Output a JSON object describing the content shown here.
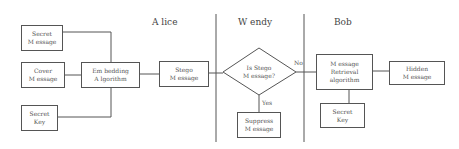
{
  "lanes": {
    "alice": "A lice",
    "wendy": "W endy",
    "bob": "Bob"
  },
  "alice": {
    "secret_message": [
      "Secret",
      "M essage"
    ],
    "cover_message": [
      "Cover",
      "M essage"
    ],
    "secret_key": [
      "Secret",
      "Key"
    ],
    "embedding_algorithm": [
      "Em bedding",
      "A lgorithm"
    ],
    "stego_message": [
      "Stego",
      "M essage"
    ]
  },
  "wendy": {
    "decision": [
      "Is Stego",
      "M essage?"
    ],
    "yes_label": "Yes",
    "no_label": "No",
    "suppress_message": [
      "Suppress",
      "M essage"
    ]
  },
  "bob": {
    "retrieval_algorithm": [
      "M essage",
      "Retrieval",
      "algorithm"
    ],
    "hidden_message": [
      "Hidden",
      "M essage"
    ],
    "secret_key": [
      "Secret",
      "Key"
    ]
  },
  "colors": {
    "line": "#555555",
    "text": "#555555",
    "background": "#ffffff"
  }
}
